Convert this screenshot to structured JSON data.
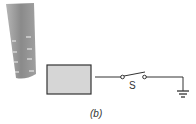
{
  "figure": {
    "switch_label": "S",
    "caption": "(b)",
    "colors": {
      "rod": "#8f8f8f",
      "box_fill": "#d6d6d6",
      "line": "#333333"
    }
  }
}
